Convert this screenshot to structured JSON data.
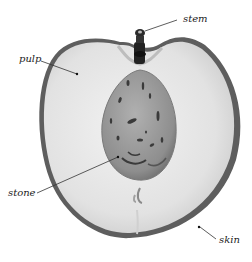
{
  "diagram": {
    "labels": {
      "stem": "stem",
      "pulp": "pulp",
      "stone": "stone",
      "skin": "skin"
    },
    "colors": {
      "skin": "#5a5a5a",
      "pulp": "#e6e6e6",
      "pulp_shadow": "#cfcfcf",
      "stone": "#9a9a9a",
      "stone_marks": "#3a3a3a",
      "stem": "#222222",
      "leader": "#333333"
    }
  }
}
